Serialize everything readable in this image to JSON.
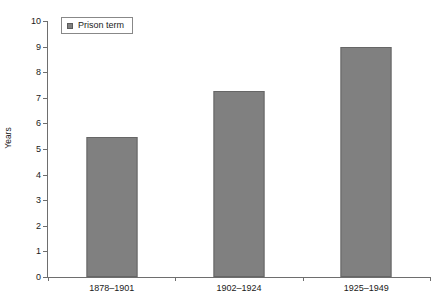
{
  "chart_data": {
    "type": "bar",
    "title": "",
    "xlabel": "",
    "ylabel": "Years",
    "categories": [
      "1878–1901",
      "1902–1924",
      "1925–1949"
    ],
    "values": [
      5.45,
      7.25,
      9.0
    ],
    "series": [
      {
        "name": "Prison term",
        "values": [
          5.45,
          7.25,
          9.0
        ]
      }
    ],
    "ylim": [
      0,
      10
    ],
    "ytick_step": 1,
    "yticks": [
      "10",
      "9",
      "8",
      "7",
      "6",
      "5",
      "4",
      "3",
      "2",
      "1",
      "0"
    ],
    "grid": false,
    "legend_position": "top-left",
    "colors": {
      "bar_fill": "#808080",
      "bar_border": "#666666",
      "axis": "#6e6e6e",
      "text": "#1a1a1a",
      "background": "#ffffff"
    }
  },
  "legend": {
    "label": "Prison term",
    "swatch_name": "legend-swatch-prison-term"
  },
  "axis": {
    "y_title": "Years"
  }
}
